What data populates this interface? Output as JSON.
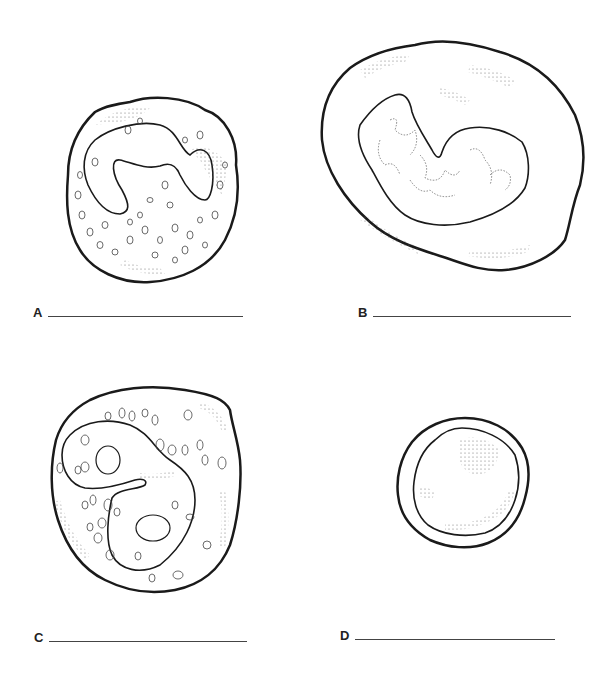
{
  "worksheet": {
    "panels": [
      {
        "id": "A",
        "letter": "A",
        "answer": "",
        "description": "cell with lobed (horseshoe/U-shaped) nucleus and many small granules"
      },
      {
        "id": "B",
        "letter": "B",
        "answer": "",
        "description": "large cell with kidney/bean-shaped nucleus and fine stippled cytoplasm"
      },
      {
        "id": "C",
        "letter": "C",
        "answer": "",
        "description": "cell with bilobed/S-shaped nucleus with nucleoli and large granules"
      },
      {
        "id": "D",
        "letter": "D",
        "answer": "",
        "description": "small round cell with large round nucleus and thin cytoplasm rim"
      }
    ]
  },
  "colors": {
    "outline": "#1a1a1a",
    "stipple": "#555555",
    "blank_line": "#444444"
  }
}
